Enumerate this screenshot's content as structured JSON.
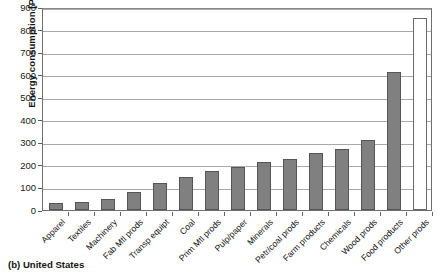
{
  "figure": {
    "caption": "(b) United States",
    "ylabel": "Energy consumption [PJ]"
  },
  "chart_data": {
    "type": "bar",
    "title": "",
    "subtitle": "",
    "caption": "(b) United States",
    "xlabel": "",
    "ylabel": "Energy consumption [PJ]",
    "units": "PJ",
    "ylim": [
      0,
      900
    ],
    "ytick_step": 100,
    "yticks": [
      0,
      100,
      200,
      300,
      400,
      500,
      600,
      700,
      800,
      900
    ],
    "ytick_labels": [
      "0",
      "100",
      "200",
      "300",
      "400",
      "500",
      "600",
      "700",
      "800",
      "900"
    ],
    "grid": true,
    "grid_axis": "y",
    "legend": false,
    "legend_position": "none",
    "bar_color": "#808080",
    "bar_edge_color": "#555555",
    "highlight_bar_color": "#ffffff",
    "categories": [
      "Apparel",
      "Textiles",
      "Machinery",
      "Fab Mtl prods",
      "Transp equipt",
      "Coal",
      "Prim Mtl prods",
      "Pulp/paper",
      "Minerals",
      "Petr/coal prods",
      "Farm products",
      "Chemicals",
      "Wood prods",
      "Food products",
      "Other prods"
    ],
    "values": [
      32,
      36,
      48,
      82,
      118,
      145,
      172,
      190,
      215,
      228,
      252,
      272,
      310,
      613,
      850
    ],
    "bar_styles": [
      "filled",
      "filled",
      "filled",
      "filled",
      "filled",
      "filled",
      "filled",
      "filled",
      "filled",
      "filled",
      "filled",
      "filled",
      "filled",
      "filled",
      "hollow"
    ]
  }
}
